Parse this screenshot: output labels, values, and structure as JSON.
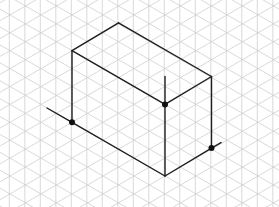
{
  "figure": {
    "title": "",
    "background_color": "#ffffff",
    "grid": {
      "type": "isometric-triangle",
      "color": "#cfcfcf",
      "column_spacing_px": 15.5,
      "unit_length_px": 17.9,
      "x_offset": 9.3,
      "vertical_offset": 14.9,
      "diag_down_offset": 9.13,
      "diag_up_offset": 2.77
    },
    "box": {
      "color": "#1e1e1e",
      "dimensions_units": {
        "width": 3,
        "depth": 6,
        "height": 4
      },
      "vertices": {
        "top_left": [
          72,
          50.7
        ],
        "top_back": [
          118.5,
          22.8
        ],
        "top_right": [
          211.5,
          76.5
        ],
        "top_front": [
          165,
          104.4
        ],
        "bottom_left": [
          72,
          122.3
        ],
        "bottom_front": [
          165,
          176
        ],
        "bottom_right": [
          211.5,
          148.1
        ]
      },
      "edges": [
        [
          "top_left",
          "top_back"
        ],
        [
          "top_back",
          "top_right"
        ],
        [
          "top_left",
          "top_front"
        ],
        [
          "top_front",
          "top_right"
        ],
        [
          "top_left",
          "bottom_left"
        ],
        [
          "top_right",
          "bottom_right"
        ],
        [
          "top_front",
          "bottom_front"
        ],
        [
          "bottom_left",
          "bottom_front"
        ],
        [
          "bottom_front",
          "bottom_right"
        ]
      ],
      "extension_lines": [
        {
          "from": [
            47,
            108
          ],
          "to": [
            72,
            122.3
          ]
        },
        {
          "from": [
            211.5,
            148.1
          ],
          "to": [
            221,
            142.6
          ]
        },
        {
          "from": [
            165,
            76.5
          ],
          "to": [
            165,
            104.4
          ]
        }
      ],
      "marked_points": [
        {
          "name": "bottom-left-point",
          "at": [
            72,
            122.3
          ]
        },
        {
          "name": "top-front-point",
          "at": [
            165,
            104.4
          ]
        },
        {
          "name": "bottom-right-point",
          "at": [
            211.5,
            148.1
          ]
        }
      ],
      "dot_color": "#111111"
    }
  }
}
